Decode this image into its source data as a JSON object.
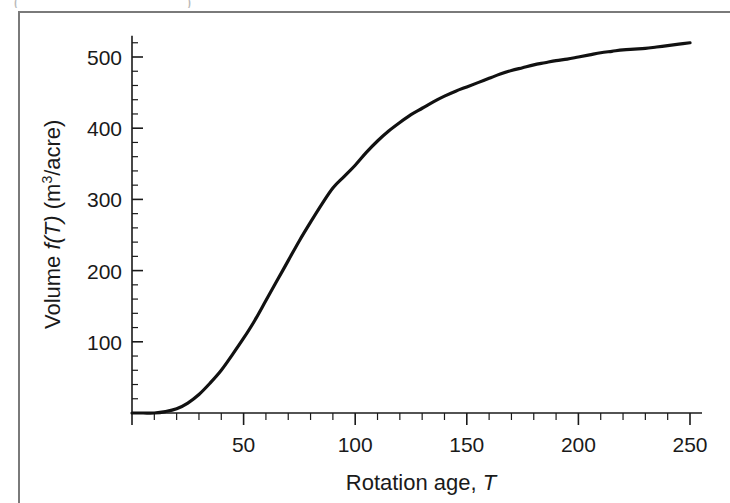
{
  "figure": {
    "caption_remnant_left": "(",
    "caption_remnant_right": ")",
    "frame_color": "#7a7a7a",
    "background": "#ffffff"
  },
  "chart_data": {
    "type": "line",
    "title": "",
    "xlabel": "Rotation age, T",
    "xlabel_parts": {
      "text": "Rotation age, ",
      "italic": "T"
    },
    "ylabel": "Volume f(T) (m³/acre)",
    "ylabel_parts": {
      "lead": "Volume ",
      "italic": "f(T)",
      "trail": " (m",
      "sup": "3",
      "tail": "/acre)"
    },
    "xlim": [
      0,
      250
    ],
    "ylim": [
      0,
      530
    ],
    "xticks": [
      50,
      100,
      150,
      200,
      250
    ],
    "xtick_labels": [
      "50",
      "100",
      "150",
      "200",
      "250"
    ],
    "xtick_minor_step": 10,
    "yticks": [
      100,
      200,
      300,
      400,
      500
    ],
    "ytick_labels": [
      "100",
      "200",
      "300",
      "400",
      "500"
    ],
    "ytick_minor_step": 20,
    "grid": false,
    "legend": null,
    "line_color": "#111111",
    "line_width": 3.2,
    "series": [
      {
        "name": "f(T)",
        "x": [
          0,
          5,
          10,
          15,
          20,
          25,
          30,
          35,
          40,
          45,
          50,
          55,
          60,
          65,
          70,
          75,
          80,
          85,
          90,
          95,
          100,
          105,
          110,
          115,
          120,
          125,
          130,
          135,
          140,
          145,
          150,
          155,
          160,
          165,
          170,
          175,
          180,
          185,
          190,
          195,
          200,
          205,
          210,
          215,
          220,
          225,
          230,
          235,
          240,
          245,
          250
        ],
        "y": [
          0,
          0,
          0,
          2,
          6,
          14,
          26,
          42,
          60,
          82,
          105,
          130,
          158,
          186,
          214,
          242,
          268,
          293,
          316,
          332,
          348,
          366,
          382,
          396,
          408,
          419,
          428,
          437,
          445,
          452,
          458,
          464,
          470,
          476,
          481,
          485,
          489,
          492,
          495,
          497,
          500,
          503,
          506,
          508,
          510,
          511,
          512,
          514,
          516,
          518,
          520
        ]
      }
    ]
  },
  "geometry": {
    "origin_px": {
      "x": 132,
      "y": 413
    },
    "x_px_per_unit": 2.232,
    "y_px_per_unit": 0.712
  }
}
